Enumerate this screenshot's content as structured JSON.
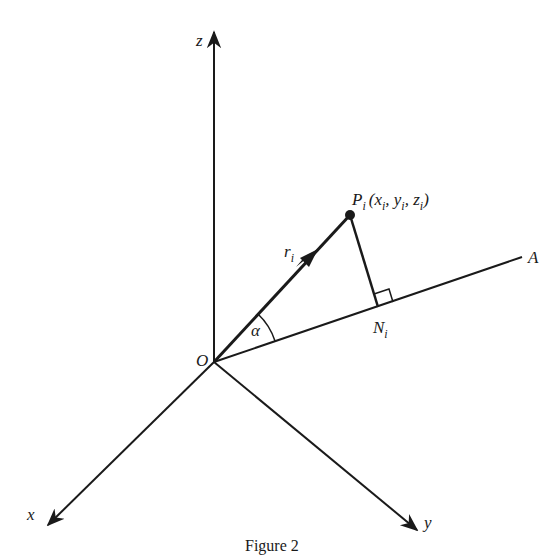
{
  "figure": {
    "caption": "Figure 2",
    "colors": {
      "ink": "#1a1a1a",
      "background": "#ffffff"
    }
  },
  "labels": {
    "z_axis": "z",
    "x_axis": "x",
    "y_axis": "y",
    "origin": "O",
    "line_A": "A",
    "vector": "r",
    "vector_sub": "i",
    "angle": "α",
    "foot_point": "N",
    "foot_sub": "i",
    "point": "P",
    "point_sub": "i",
    "point_coords_open": "(x",
    "point_coords_y": ", y",
    "point_coords_z": ", z",
    "point_coords_close": ")",
    "coord_sub": "i"
  }
}
